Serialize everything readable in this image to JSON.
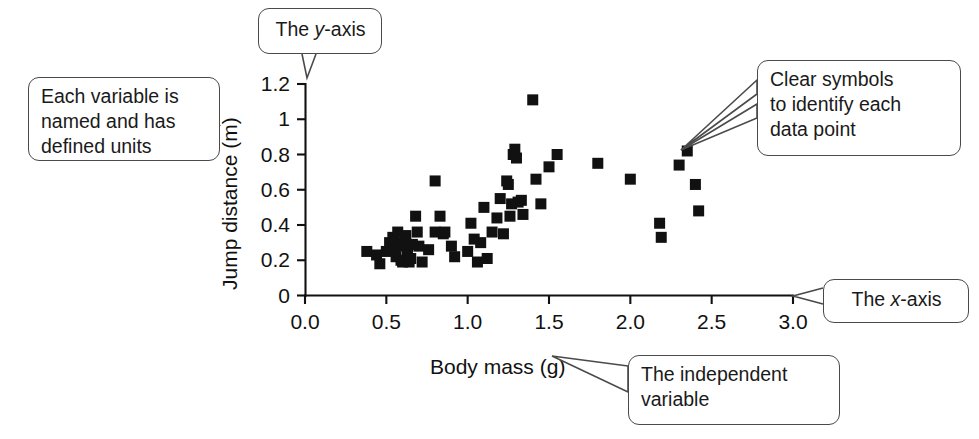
{
  "figure": {
    "background_color": "#ffffff",
    "marker_color": "#111111",
    "callout_border_color": "#4a4a4a"
  },
  "chart_data": {
    "type": "scatter",
    "title": "",
    "xlabel": "Body mass (g)",
    "ylabel": "Jump distance (m)",
    "xlim": [
      0.0,
      3.0
    ],
    "ylim": [
      0.0,
      1.2
    ],
    "xticks": [
      "0.0",
      "0.5",
      "1.0",
      "1.5",
      "2.0",
      "2.5",
      "3.0"
    ],
    "xtick_values": [
      0.0,
      0.5,
      1.0,
      1.5,
      2.0,
      2.5,
      3.0
    ],
    "yticks": [
      "0",
      "0.2",
      "0.4",
      "0.6",
      "0.8",
      "1",
      "1.2"
    ],
    "ytick_values": [
      0.0,
      0.2,
      0.4,
      0.6,
      0.8,
      1.0,
      1.2
    ],
    "grid": false,
    "legend": false,
    "marker_shape": "square",
    "series": [
      {
        "name": "Jump distance vs body mass",
        "points": [
          [
            0.38,
            0.25
          ],
          [
            0.44,
            0.23
          ],
          [
            0.46,
            0.18
          ],
          [
            0.5,
            0.25
          ],
          [
            0.52,
            0.3
          ],
          [
            0.54,
            0.33
          ],
          [
            0.55,
            0.26
          ],
          [
            0.56,
            0.22
          ],
          [
            0.57,
            0.36
          ],
          [
            0.58,
            0.28
          ],
          [
            0.59,
            0.2
          ],
          [
            0.6,
            0.3
          ],
          [
            0.6,
            0.19
          ],
          [
            0.62,
            0.34
          ],
          [
            0.63,
            0.26
          ],
          [
            0.64,
            0.19
          ],
          [
            0.65,
            0.21
          ],
          [
            0.66,
            0.29
          ],
          [
            0.68,
            0.45
          ],
          [
            0.69,
            0.36
          ],
          [
            0.7,
            0.28
          ],
          [
            0.72,
            0.19
          ],
          [
            0.76,
            0.26
          ],
          [
            0.8,
            0.65
          ],
          [
            0.8,
            0.36
          ],
          [
            0.83,
            0.45
          ],
          [
            0.85,
            0.35
          ],
          [
            0.86,
            0.36
          ],
          [
            0.9,
            0.28
          ],
          [
            0.92,
            0.22
          ],
          [
            1.0,
            0.25
          ],
          [
            1.02,
            0.41
          ],
          [
            1.04,
            0.32
          ],
          [
            1.06,
            0.19
          ],
          [
            1.08,
            0.3
          ],
          [
            1.1,
            0.5
          ],
          [
            1.12,
            0.21
          ],
          [
            1.15,
            0.36
          ],
          [
            1.18,
            0.44
          ],
          [
            1.2,
            0.55
          ],
          [
            1.22,
            0.35
          ],
          [
            1.24,
            0.65
          ],
          [
            1.25,
            0.63
          ],
          [
            1.26,
            0.45
          ],
          [
            1.27,
            0.52
          ],
          [
            1.28,
            0.8
          ],
          [
            1.29,
            0.83
          ],
          [
            1.3,
            0.78
          ],
          [
            1.31,
            0.53
          ],
          [
            1.33,
            0.54
          ],
          [
            1.34,
            0.46
          ],
          [
            1.4,
            1.11
          ],
          [
            1.42,
            0.66
          ],
          [
            1.45,
            0.52
          ],
          [
            1.5,
            0.73
          ],
          [
            1.55,
            0.8
          ],
          [
            1.8,
            0.75
          ],
          [
            2.0,
            0.66
          ],
          [
            2.18,
            0.41
          ],
          [
            2.19,
            0.33
          ],
          [
            2.3,
            0.74
          ],
          [
            2.35,
            0.82
          ],
          [
            2.4,
            0.63
          ],
          [
            2.42,
            0.48
          ]
        ]
      }
    ]
  },
  "callouts": [
    {
      "id": "y-axis",
      "text_prefix": "The ",
      "emphasis": "y",
      "text_suffix": "-axis",
      "target": "y-axis"
    },
    {
      "id": "variable",
      "text": "Each variable is named and has defined units",
      "target": "axis-titles"
    },
    {
      "id": "symbols",
      "text": "Clear symbols to identify each data point",
      "target": "data-markers"
    },
    {
      "id": "x-axis",
      "text_prefix": "The ",
      "emphasis": "x",
      "text_suffix": "-axis",
      "target": "x-axis"
    },
    {
      "id": "independent",
      "text": "The independent variable",
      "target": "x-axis-title"
    }
  ],
  "callout_text": {
    "y_axis_prefix": "The ",
    "y_axis_emphasis": "y",
    "y_axis_suffix": "-axis",
    "variable_line1": "Each variable is",
    "variable_line2": "named and has",
    "variable_line3": "defined units",
    "symbols_line1": "Clear symbols",
    "symbols_line2": "to identify each",
    "symbols_line3": "data point",
    "x_axis_prefix": "The ",
    "x_axis_emphasis": "x",
    "x_axis_suffix": "-axis",
    "independent_line1": "The independent",
    "independent_line2": "variable"
  }
}
